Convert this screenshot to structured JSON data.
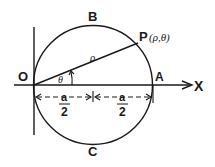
{
  "diagram": {
    "labels": {
      "top_point": "B",
      "bottom_point": "C",
      "origin": "O",
      "end_point": "A",
      "axis": "X",
      "point_p": "P",
      "point_p_coords": "(ρ,θ)",
      "radius_label": "ρ",
      "angle_label": "θ",
      "half_left_num": "a",
      "half_left_den": "2",
      "half_right_num": "a",
      "half_right_den": "2"
    },
    "colors": {
      "stroke": "#1a1a1a",
      "background": "#ffffff"
    }
  }
}
